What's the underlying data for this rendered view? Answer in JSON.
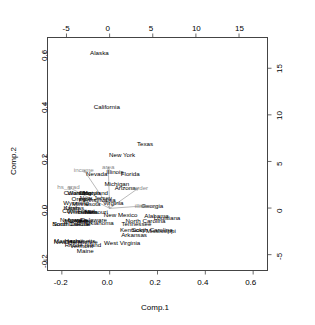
{
  "chart_data": {
    "type": "scatter",
    "title": "",
    "subtitle": "",
    "xlabel": "Comp.1",
    "ylabel": "Comp.2",
    "xlabel_top": "",
    "ylabel_right": "",
    "grid": false,
    "legend": "none",
    "xlim": [
      -0.26,
      0.66
    ],
    "ylim": [
      -0.24,
      0.66
    ],
    "xlim_top": [
      -7.2,
      18.3
    ],
    "ylim_right": [
      -6.7,
      18.3
    ],
    "x_ticks": [
      "-0.2",
      "0.0",
      "0.2",
      "0.4",
      "0.6"
    ],
    "x_tick_values": [
      -0.2,
      0.0,
      0.2,
      0.4,
      0.6
    ],
    "y_ticks": [
      "-0.2",
      "0.0",
      "0.2",
      "0.4",
      "0.6"
    ],
    "y_tick_values": [
      -0.2,
      0.0,
      0.2,
      0.4,
      0.6
    ],
    "x_ticks_top": [
      "-5",
      "0",
      "5",
      "10",
      "15"
    ],
    "x_tick_values_top": [
      -5,
      0,
      5,
      10,
      15
    ],
    "y_ticks_right": [
      "-5",
      "0",
      "5",
      "10",
      "15"
    ],
    "y_tick_values_right": [
      -5,
      0,
      5,
      10,
      15
    ],
    "point_color": "#000000",
    "arrow_color": "#8a8a8a",
    "points": [
      {
        "label": "Alaska",
        "x": -0.043,
        "y": 0.6
      },
      {
        "label": "California",
        "x": -0.012,
        "y": 0.39
      },
      {
        "label": "Texas",
        "x": 0.148,
        "y": 0.247
      },
      {
        "label": "New York",
        "x": 0.052,
        "y": 0.205
      },
      {
        "label": "Illinois",
        "x": 0.022,
        "y": 0.142
      },
      {
        "label": "Florida",
        "x": 0.086,
        "y": 0.131
      },
      {
        "label": "Nevada",
        "x": -0.054,
        "y": 0.131
      },
      {
        "label": "Michigan",
        "x": 0.03,
        "y": 0.094
      },
      {
        "label": "Arizona",
        "x": 0.065,
        "y": 0.08
      },
      {
        "label": "Colorado",
        "x": -0.14,
        "y": 0.058
      },
      {
        "label": "Washington",
        "x": -0.108,
        "y": 0.058
      },
      {
        "label": "Ohio",
        "x": -0.102,
        "y": 0.058
      },
      {
        "label": "Maryland",
        "x": -0.06,
        "y": 0.06
      },
      {
        "label": "Oregon",
        "x": -0.116,
        "y": 0.035
      },
      {
        "label": "New Jersey",
        "x": -0.058,
        "y": 0.04
      },
      {
        "label": "Pennsylvania",
        "x": -0.052,
        "y": 0.033
      },
      {
        "label": "Wyoming",
        "x": -0.14,
        "y": 0.02
      },
      {
        "label": "Minnesota",
        "x": -0.098,
        "y": 0.018
      },
      {
        "label": "Virginia",
        "x": 0.015,
        "y": 0.02
      },
      {
        "label": "Georgia",
        "x": 0.178,
        "y": 0.01
      },
      {
        "label": "Kansas",
        "x": -0.15,
        "y": 0.002
      },
      {
        "label": "Utah",
        "x": -0.156,
        "y": 0.002
      },
      {
        "label": "Connecticut",
        "x": -0.13,
        "y": -0.01
      },
      {
        "label": "Wisconsin",
        "x": -0.118,
        "y": -0.013
      },
      {
        "label": "Indiana",
        "x": -0.092,
        "y": -0.014
      },
      {
        "label": "Missouri",
        "x": -0.056,
        "y": -0.014
      },
      {
        "label": "New Mexico",
        "x": 0.046,
        "y": -0.026
      },
      {
        "label": "Alabama",
        "x": 0.196,
        "y": -0.03
      },
      {
        "label": "Louisiana",
        "x": 0.24,
        "y": -0.036
      },
      {
        "label": "Nebraska",
        "x": -0.152,
        "y": -0.044
      },
      {
        "label": "Iowa",
        "x": -0.146,
        "y": -0.046
      },
      {
        "label": "Montana",
        "x": -0.14,
        "y": -0.048
      },
      {
        "label": "Delaware",
        "x": -0.066,
        "y": -0.044
      },
      {
        "label": "Idaho",
        "x": -0.106,
        "y": -0.05
      },
      {
        "label": "Oklahoma",
        "x": -0.042,
        "y": -0.056
      },
      {
        "label": "North Carolina",
        "x": 0.15,
        "y": -0.048
      },
      {
        "label": "Tennessee",
        "x": 0.112,
        "y": -0.06
      },
      {
        "label": "South Dakota",
        "x": -0.16,
        "y": -0.062
      },
      {
        "label": "North Dakota",
        "x": -0.164,
        "y": -0.062
      },
      {
        "label": "Kentucky",
        "x": 0.096,
        "y": -0.084
      },
      {
        "label": "South Carolina",
        "x": 0.178,
        "y": -0.082
      },
      {
        "label": "Mississippi",
        "x": 0.214,
        "y": -0.086
      },
      {
        "label": "Arkansas",
        "x": 0.102,
        "y": -0.104
      },
      {
        "label": "West Virginia",
        "x": 0.052,
        "y": -0.132
      },
      {
        "label": "Massachusetts",
        "x": -0.146,
        "y": -0.126
      },
      {
        "label": "New Hampshire",
        "x": -0.142,
        "y": -0.13
      },
      {
        "label": "Hawaii",
        "x": -0.15,
        "y": -0.126
      },
      {
        "label": "Rhode Island",
        "x": -0.112,
        "y": -0.142
      },
      {
        "label": "Vermont",
        "x": -0.118,
        "y": -0.146
      },
      {
        "label": "Maine",
        "x": -0.102,
        "y": -0.164
      }
    ],
    "loadings": [
      {
        "label": "income",
        "x": -0.108,
        "y": 0.148,
        "tip_x": -0.06,
        "tip_y": 0.048
      },
      {
        "label": "area",
        "x": -0.006,
        "y": 0.16,
        "tip_x": -0.03,
        "tip_y": 0.04
      },
      {
        "label": "hs_grad",
        "x": -0.172,
        "y": 0.082,
        "tip_x": -0.075,
        "tip_y": 0.03
      },
      {
        "label": "murder",
        "x": 0.12,
        "y": 0.078,
        "tip_x": 0.08,
        "tip_y": 0.05
      },
      {
        "label": "illiteracy",
        "x": 0.152,
        "y": 0.01,
        "tip_x": 0.06,
        "tip_y": 0.015
      }
    ]
  },
  "axes": {
    "bottom_title": "Comp.1",
    "left_title": "Comp.2"
  }
}
